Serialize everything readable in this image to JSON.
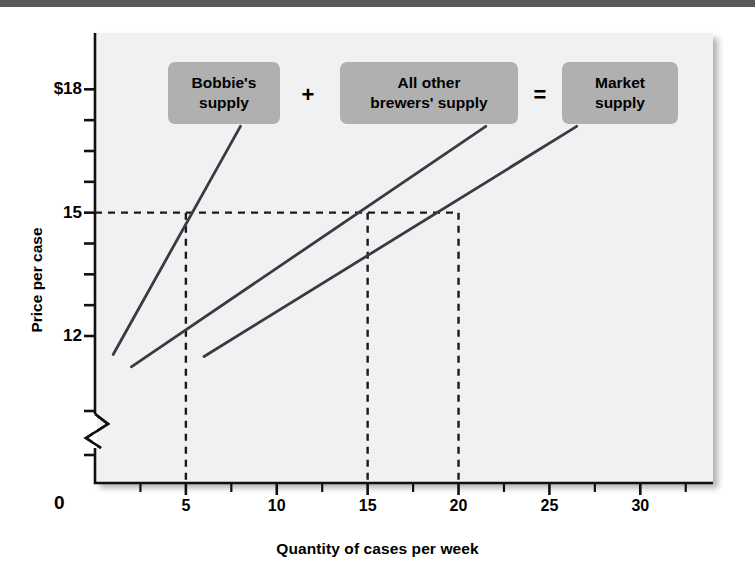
{
  "figure": {
    "background_color": "#ffffff",
    "panel_color": "#f1f1f1",
    "top_rule_color": "#5a5a5a",
    "callout_color": "#b0b0b0",
    "line_color": "#3a3a46"
  },
  "axis_titles": {
    "x": "Quantity of cases per week",
    "y": "Price per case"
  },
  "origin_label": "0",
  "callouts": {
    "bobbie": "Bobbie's\nsupply",
    "plus": "+",
    "others": "All other\nbrewers' supply",
    "equals": "=",
    "market": "Market\nsupply"
  },
  "chart_data": {
    "type": "line",
    "title": "",
    "xlabel": "Quantity of cases per week",
    "ylabel": "Price per case",
    "xlim": [
      0,
      34
    ],
    "ylim": [
      10.2,
      19.2
    ],
    "grid": false,
    "y_axis_break": true,
    "legend_position": "callout-boxes-top",
    "x_ticks_major": [
      0,
      5,
      10,
      15,
      20,
      25,
      30
    ],
    "x_tick_labels": [
      "0",
      "5",
      "10",
      "15",
      "20",
      "25",
      "30"
    ],
    "x_minor_tick_step": 2.5,
    "y_ticks_major": [
      12,
      15,
      18
    ],
    "y_tick_labels": [
      "12",
      "15",
      "$18"
    ],
    "y_minor_ticks": [
      12.75,
      13.5,
      14.25,
      15.75,
      16.5,
      17.25
    ],
    "reference_price": 15,
    "reference_quantities": [
      5,
      15,
      20
    ],
    "series": [
      {
        "name": "Bobbie's supply",
        "points": [
          [
            1.0,
            11.55
          ],
          [
            8.0,
            17.1
          ]
        ],
        "price_at_15": 5
      },
      {
        "name": "All other brewers' supply",
        "points": [
          [
            2.0,
            11.25
          ],
          [
            21.5,
            17.1
          ]
        ],
        "price_at_15": 15
      },
      {
        "name": "Market supply",
        "points": [
          [
            6.0,
            11.5
          ],
          [
            26.5,
            17.1
          ]
        ],
        "price_at_15": 20
      }
    ],
    "annotations": [
      {
        "text": "Bobbie's supply",
        "kind": "callout-box"
      },
      {
        "text": "+",
        "kind": "operator"
      },
      {
        "text": "All other brewers' supply",
        "kind": "callout-box"
      },
      {
        "text": "=",
        "kind": "operator"
      },
      {
        "text": "Market supply",
        "kind": "callout-box"
      }
    ]
  }
}
